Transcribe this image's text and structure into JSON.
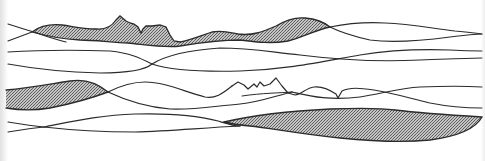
{
  "artwork": {
    "description": "Abstract line drawing of flowing wavy bands resembling a layered landscape with mountain-like ridges; some bands filled with gray hatching",
    "colors": {
      "background": "#ffffff",
      "stroke": "#2b2b2b",
      "hatch_dark": "#5a5a5a",
      "hatch_light": "#b8b8b8"
    },
    "bands": [
      {
        "id": "band-1",
        "label": "upper shaded ridge band (mountain peaks)",
        "filled": true
      },
      {
        "id": "band-2",
        "label": "upper right crossing lines",
        "filled": false
      },
      {
        "id": "band-3",
        "label": "second row parallel lines",
        "filled": false
      },
      {
        "id": "band-4",
        "label": "middle left shaded band",
        "filled": true
      },
      {
        "id": "band-5",
        "label": "middle ridge line with small peaks",
        "filled": false
      },
      {
        "id": "band-6",
        "label": "lower crossing lines",
        "filled": false
      },
      {
        "id": "band-7",
        "label": "lower right shaded band",
        "filled": true
      }
    ]
  }
}
